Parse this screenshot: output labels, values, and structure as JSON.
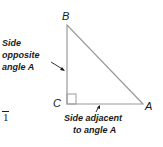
{
  "diagram": {
    "vertices": {
      "A": {
        "label": "A",
        "x": 143,
        "y": 104
      },
      "B": {
        "label": "B",
        "x": 67,
        "y": 25
      },
      "C": {
        "label": "C",
        "x": 67,
        "y": 104
      }
    },
    "right_angle_at": "C",
    "labels": {
      "opposite": [
        "Side",
        "opposite",
        "angle A"
      ],
      "adjacent": [
        "Side adjacent",
        "to angle A"
      ]
    },
    "edge_fragment": "1",
    "colors": {
      "line": "#9a9a9a",
      "text": "#1a1a1a"
    }
  }
}
